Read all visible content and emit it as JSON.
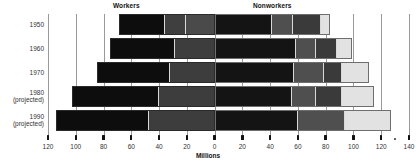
{
  "headers": {
    "workers": "Workers",
    "nonworkers": "Nonworkers"
  },
  "axis": {
    "title": "Millions",
    "ticks": [
      "120",
      "100",
      "80",
      "60",
      "40",
      "20",
      "0",
      "20",
      "40",
      "60",
      "80",
      "100",
      "120",
      "140"
    ]
  },
  "rows": [
    {
      "label_line1": "1950",
      "label_line2": ""
    },
    {
      "label_line1": "1960",
      "label_line2": ""
    },
    {
      "label_line1": "1970",
      "label_line2": ""
    },
    {
      "label_line1": "1980",
      "label_line2": "(projected)"
    },
    {
      "label_line1": "1990",
      "label_line2": "(projected)"
    }
  ],
  "chart_data": {
    "type": "bar",
    "title": "",
    "subtype": "diverging-stacked-horizontal",
    "xlabel": "Millions",
    "ylabel": "",
    "xlim": [
      -120,
      140
    ],
    "grid": true,
    "legend_position": "top",
    "categories": [
      "1950",
      "1960",
      "1970",
      "1980 (projected)",
      "1990 (projected)"
    ],
    "groups": [
      "Workers",
      "Nonworkers"
    ],
    "tick_values": [
      -120,
      -100,
      -80,
      -60,
      -40,
      -20,
      0,
      20,
      40,
      60,
      80,
      100,
      120,
      140
    ],
    "tick_labels": [
      "120",
      "100",
      "80",
      "60",
      "40",
      "20",
      "0",
      "20",
      "40",
      "60",
      "80",
      "100",
      "120",
      "140"
    ],
    "series": [
      {
        "name": "Workers (left of zero, millions)",
        "side": "left",
        "values": [
          69,
          75,
          85,
          103,
          114
        ],
        "segments": [
          {
            "category": "1950",
            "parts": [
              {
                "value": 20,
                "shade": "#4a4a4a"
              },
              {
                "value": 16,
                "shade": "#3f3f3f"
              },
              {
                "value": 33,
                "shade": "#0d0d0d"
              }
            ]
          },
          {
            "category": "1960",
            "parts": [
              {
                "value": 28,
                "shade": "#3d3d3d"
              },
              {
                "value": 47,
                "shade": "#0d0d0d"
              }
            ]
          },
          {
            "category": "1970",
            "parts": [
              {
                "value": 32,
                "shade": "#3d3d3d"
              },
              {
                "value": 53,
                "shade": "#0d0d0d"
              }
            ]
          },
          {
            "category": "1980 (projected)",
            "parts": [
              {
                "value": 40,
                "shade": "#3d3d3d"
              },
              {
                "value": 63,
                "shade": "#0d0d0d"
              }
            ]
          },
          {
            "category": "1990 (projected)",
            "parts": [
              {
                "value": 47,
                "shade": "#3d3d3d"
              },
              {
                "value": 67,
                "shade": "#0d0d0d"
              }
            ]
          }
        ]
      },
      {
        "name": "Nonworkers (right of zero, millions)",
        "side": "right",
        "values": [
          83,
          99,
          111,
          115,
          127
        ],
        "segments": [
          {
            "category": "1950",
            "parts": [
              {
                "value": 41,
                "shade": "#141414"
              },
              {
                "value": 16,
                "shade": "#4f4f4f"
              },
              {
                "value": 20,
                "shade": "#3a3a3a"
              },
              {
                "value": 6,
                "shade": "#e2e2e2"
              }
            ]
          },
          {
            "category": "1960",
            "parts": [
              {
                "value": 59,
                "shade": "#141414"
              },
              {
                "value": 14,
                "shade": "#4f4f4f"
              },
              {
                "value": 16,
                "shade": "#3a3a3a"
              },
              {
                "value": 10,
                "shade": "#e2e2e2"
              }
            ]
          },
          {
            "category": "1970",
            "parts": [
              {
                "value": 57,
                "shade": "#141414"
              },
              {
                "value": 22,
                "shade": "#4f4f4f"
              },
              {
                "value": 13,
                "shade": "#3a3a3a"
              },
              {
                "value": 19,
                "shade": "#e2e2e2"
              }
            ]
          },
          {
            "category": "1980 (projected)",
            "parts": [
              {
                "value": 56,
                "shade": "#141414"
              },
              {
                "value": 17,
                "shade": "#4f4f4f"
              },
              {
                "value": 19,
                "shade": "#3a3a3a"
              },
              {
                "value": 23,
                "shade": "#e2e2e2"
              }
            ]
          },
          {
            "category": "1990 (projected)",
            "parts": [
              {
                "value": 60,
                "shade": "#141414"
              },
              {
                "value": 34,
                "shade": "#4f4f4f"
              },
              {
                "value": 33,
                "shade": "#e2e2e2"
              }
            ]
          }
        ]
      }
    ]
  }
}
